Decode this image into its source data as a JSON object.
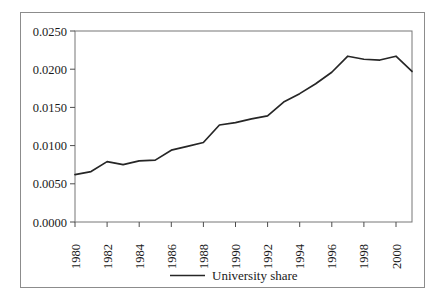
{
  "chart_data": {
    "type": "line",
    "title": "",
    "subtitle": "",
    "xlabel": "",
    "ylabel": "",
    "grid": false,
    "legend_position": "bottom-center",
    "xlim": [
      1980,
      2001
    ],
    "ylim": [
      0.0,
      0.025
    ],
    "x_tick_labels": [
      "1980",
      "1982",
      "1984",
      "1986",
      "1988",
      "1990",
      "1992",
      "1994",
      "1996",
      "1998",
      "2000"
    ],
    "x_ticks": [
      1980,
      1982,
      1984,
      1986,
      1988,
      1990,
      1992,
      1994,
      1996,
      1998,
      2000
    ],
    "y_tick_labels": [
      "0.0000",
      "0.0050",
      "0.0100",
      "0.0150",
      "0.0200",
      "0.0250"
    ],
    "y_ticks": [
      0.0,
      0.005,
      0.01,
      0.015,
      0.02,
      0.025
    ],
    "x": [
      1980,
      1981,
      1982,
      1983,
      1984,
      1985,
      1986,
      1987,
      1988,
      1989,
      1990,
      1991,
      1992,
      1993,
      1994,
      1995,
      1996,
      1997,
      1998,
      1999,
      2000,
      2001
    ],
    "series": [
      {
        "name": "University share",
        "color": "#262626",
        "values": [
          0.0062,
          0.0066,
          0.0079,
          0.0075,
          0.008,
          0.0081,
          0.0094,
          0.0099,
          0.0104,
          0.0127,
          0.013,
          0.0135,
          0.0139,
          0.0157,
          0.0168,
          0.0181,
          0.0196,
          0.0217,
          0.0213,
          0.0212,
          0.0217,
          0.0197
        ]
      }
    ]
  },
  "legend": {
    "entries": [
      {
        "label": "University share",
        "color": "#262626"
      }
    ]
  },
  "axes": {
    "y_labels": [
      "0.0250",
      "0.0200",
      "0.0150",
      "0.0100",
      "0.0050",
      "0.0000"
    ],
    "x_labels": [
      "1980",
      "1982",
      "1984",
      "1986",
      "1988",
      "1990",
      "1992",
      "1994",
      "1996",
      "1998",
      "2000"
    ]
  }
}
